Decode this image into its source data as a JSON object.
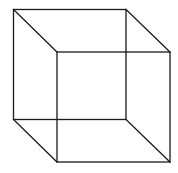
{
  "diagram": {
    "type": "wireframe-cube",
    "stroke_color": "#1a1a1a",
    "background": "#ffffff",
    "back_face": {
      "x1": 13.5,
      "y1": 9.5,
      "x2": 126,
      "y2": 119.5
    },
    "front_face": {
      "x1": 57,
      "y1": 52,
      "x2": 170,
      "y2": 162
    }
  }
}
